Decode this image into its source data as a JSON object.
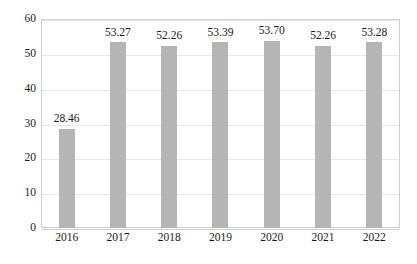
{
  "chart_data": {
    "type": "bar",
    "title": "",
    "subtitle": "",
    "xlabel": "",
    "ylabel": "",
    "categories": [
      "2016",
      "2017",
      "2018",
      "2019",
      "2020",
      "2021",
      "2022"
    ],
    "values": [
      28.46,
      53.27,
      52.26,
      53.39,
      53.7,
      52.26,
      53.28
    ],
    "value_labels": [
      "28.46",
      "53.27",
      "52.26",
      "53.39",
      "53.70",
      "52.26",
      "53.28"
    ],
    "ylim": [
      0,
      60
    ],
    "ytick_step": 10,
    "ytick_labels": [
      "0",
      "10",
      "20",
      "30",
      "40",
      "50",
      "60"
    ],
    "ytick_values": [
      0,
      10,
      20,
      30,
      40,
      50,
      60
    ],
    "grid": true,
    "grid_axis": "y",
    "legend": false,
    "legend_position": "none",
    "series": [
      {
        "name": "",
        "values": [
          28.46,
          53.27,
          52.26,
          53.39,
          53.7,
          52.26,
          53.28
        ]
      }
    ],
    "colors": {
      "bar": "#b5b5b5",
      "gridline": "#e9e9e9",
      "axis_line": "#d0d0d0",
      "text": "#1a1a1a",
      "background": "#ffffff"
    }
  }
}
